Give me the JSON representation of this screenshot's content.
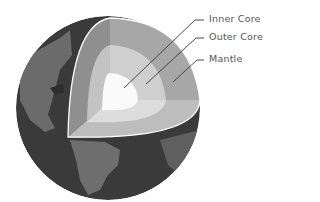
{
  "diagram": {
    "labels": [
      {
        "id": "inner-core",
        "text": "Inner Core"
      },
      {
        "id": "outer-core",
        "text": "Outer Core"
      },
      {
        "id": "mantle",
        "text": "Mantle"
      }
    ],
    "colors": {
      "ocean": "#3a3a3a",
      "land": "#6e6e6e",
      "land_dark": "#555555",
      "crust_edge": "#ffffff",
      "mantle_light": "#bdbdbd",
      "mantle_mid": "#a7a7a7",
      "mantle_dark": "#8f8f8f",
      "outer_core_light": "#dcdcdc",
      "outer_core_mid": "#cfcfcf",
      "outer_core_dark": "#c3c3c3",
      "inner_core": "#fafafa",
      "leader_line": "#3a3a3a",
      "label_text": "#555555"
    }
  }
}
